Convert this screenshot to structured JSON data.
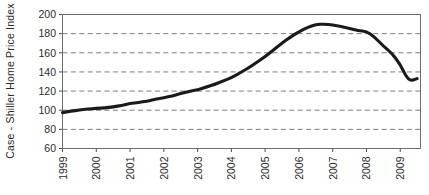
{
  "chart_data": {
    "type": "line",
    "title": "",
    "xlabel": "",
    "ylabel": "Case - Shiller Home Price Index",
    "xlim": [
      1999,
      2009.6
    ],
    "ylim": [
      60,
      200
    ],
    "grid": true,
    "legend": false,
    "x_tick_labels": [
      "1999",
      "2000",
      "2001",
      "2002",
      "2003",
      "2004",
      "2005",
      "2006",
      "2007",
      "2008",
      "2009"
    ],
    "x_ticks": [
      1999,
      2000,
      2001,
      2002,
      2003,
      2004,
      2005,
      2006,
      2007,
      2008,
      2009
    ],
    "y_tick_labels": [
      "60",
      "80",
      "100",
      "120",
      "140",
      "160",
      "180",
      "200"
    ],
    "y_ticks": [
      60,
      80,
      100,
      120,
      140,
      160,
      180,
      200
    ],
    "series": [
      {
        "name": "Case - Shiller Home Price Index",
        "color": "#1a1a1a",
        "x": [
          1999.0,
          1999.25,
          1999.5,
          1999.75,
          2000.0,
          2000.25,
          2000.5,
          2000.75,
          2001.0,
          2001.25,
          2001.5,
          2001.75,
          2002.0,
          2002.25,
          2002.5,
          2002.75,
          2003.0,
          2003.25,
          2003.5,
          2003.75,
          2004.0,
          2004.25,
          2004.5,
          2004.75,
          2005.0,
          2005.25,
          2005.5,
          2005.75,
          2006.0,
          2006.25,
          2006.5,
          2006.75,
          2007.0,
          2007.25,
          2007.5,
          2007.75,
          2008.0,
          2008.25,
          2008.5,
          2008.75,
          2009.0,
          2009.25,
          2009.5
        ],
        "values": [
          97.5,
          99.0,
          100.2,
          101.2,
          101.8,
          102.5,
          103.5,
          105.0,
          107.0,
          108.0,
          109.5,
          111.5,
          113.0,
          115.0,
          117.5,
          119.5,
          121.5,
          124.0,
          127.0,
          130.5,
          134.0,
          139.0,
          144.0,
          150.0,
          156.0,
          163.0,
          170.0,
          176.5,
          182.0,
          186.5,
          189.5,
          190.0,
          189.0,
          187.5,
          185.5,
          183.0,
          182.5,
          176.0,
          167.0,
          159.5,
          148.0,
          130.0,
          133.0
        ]
      }
    ]
  },
  "axes": {
    "y_axis_title": "Case - Shiller Home Price Index"
  }
}
